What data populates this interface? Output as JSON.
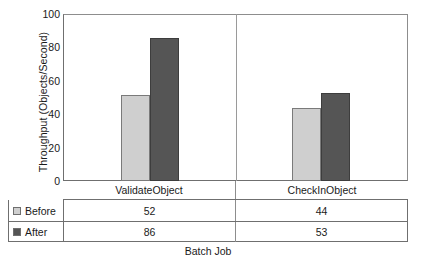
{
  "chart_data": {
    "type": "bar",
    "title": "",
    "xlabel": "Batch Job",
    "ylabel": "Throughput (Objects/Second)",
    "categories": [
      "ValidateObject",
      "CheckInObject"
    ],
    "series": [
      {
        "name": "Before",
        "values": [
          52,
          44
        ],
        "color": "#cfcfcf"
      },
      {
        "name": "After",
        "values": [
          86,
          53
        ],
        "color": "#555555"
      }
    ],
    "ylim": [
      0,
      100
    ],
    "yticks": [
      100,
      80,
      60,
      40,
      20,
      0
    ],
    "ytick_labels": [
      "100",
      "80",
      "60",
      "40",
      "20",
      "0"
    ],
    "grid": false,
    "legend_position": "data-table-left",
    "data_table": {
      "row_labels": [
        "Before",
        "After"
      ],
      "rows": [
        {
          "label": "Before",
          "values": [
            "52",
            "44"
          ]
        },
        {
          "label": "After",
          "values": [
            "86",
            "53"
          ]
        }
      ],
      "column_headers": [
        "ValidateObject",
        "CheckInObject"
      ]
    }
  }
}
